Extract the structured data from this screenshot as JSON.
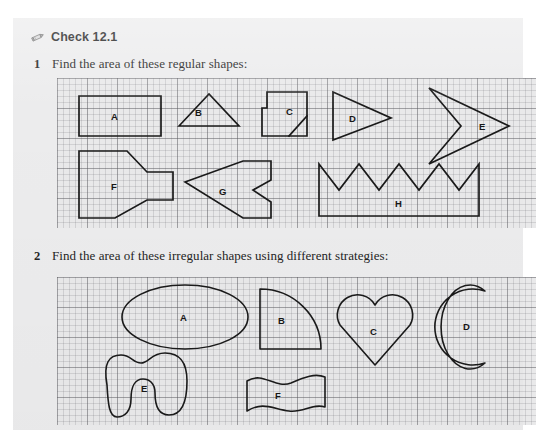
{
  "header": {
    "icon": "pencil-icon",
    "title": "Check 12.1"
  },
  "questions": [
    {
      "number": "1",
      "text": "Find the area of these regular shapes:"
    },
    {
      "number": "2",
      "text": "Find the area of these irregular shapes using different strategies:"
    }
  ],
  "grid": {
    "minor_cell_px": 6,
    "major_cell_px": 30,
    "line_color": "#5a5a5f",
    "background_color": "#e9e9ea"
  },
  "stroke_color": "#1a1a1a",
  "panel_1": {
    "caption_ref": "questions.0.text",
    "shapes": [
      {
        "label": "A",
        "kind": "rectangle",
        "label_x": 54,
        "label_y": 38
      },
      {
        "label": "B",
        "kind": "triangle",
        "label_x": 137,
        "label_y": 34
      },
      {
        "label": "C",
        "kind": "l-shape-diagonal",
        "label_x": 228,
        "label_y": 33
      },
      {
        "label": "D",
        "kind": "arrow-triangle",
        "label_x": 297,
        "label_y": 43
      },
      {
        "label": "E",
        "kind": "chevron-arrow",
        "label_x": 428,
        "label_y": 47
      },
      {
        "label": "F",
        "kind": "funnel-arrow",
        "label_x": 58,
        "label_y": 108
      },
      {
        "label": "G",
        "kind": "notched-arrow",
        "label_x": 167,
        "label_y": 113
      },
      {
        "label": "H",
        "kind": "zigzag-crown",
        "label_x": 343,
        "label_y": 125
      }
    ]
  },
  "panel_2": {
    "caption_ref": "questions.1.text",
    "shapes": [
      {
        "label": "A",
        "kind": "ellipse",
        "label_x": 128,
        "label_y": 45
      },
      {
        "label": "B",
        "kind": "quarter-circle",
        "label_x": 225,
        "label_y": 44
      },
      {
        "label": "C",
        "kind": "heart",
        "label_x": 318,
        "label_y": 55
      },
      {
        "label": "D",
        "kind": "crescent",
        "label_x": 412,
        "label_y": 49
      },
      {
        "label": "E",
        "kind": "blob",
        "label_x": 88,
        "label_y": 111
      },
      {
        "label": "F",
        "kind": "wavy-rectangle",
        "label_x": 222,
        "label_y": 117
      }
    ]
  }
}
